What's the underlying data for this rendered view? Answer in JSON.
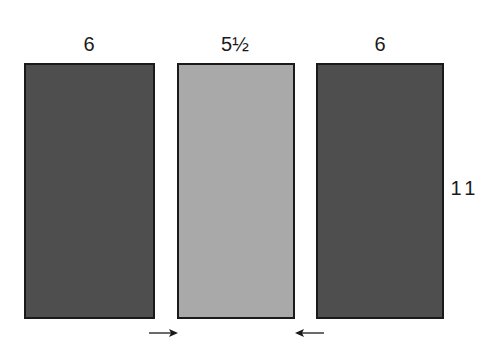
{
  "diagram": {
    "panels": [
      {
        "name": "left",
        "width_label": "6",
        "shade": "dark",
        "color": "#4e4e4e"
      },
      {
        "name": "middle",
        "width_label": "5½",
        "shade": "light",
        "color": "#a9a9a9"
      },
      {
        "name": "right",
        "width_label": "6",
        "shade": "dark",
        "color": "#4e4e4e"
      }
    ],
    "height_label": "11",
    "arrows": [
      {
        "direction": "right",
        "icon": "arrow-right-icon"
      },
      {
        "direction": "left",
        "icon": "arrow-left-icon"
      }
    ]
  }
}
